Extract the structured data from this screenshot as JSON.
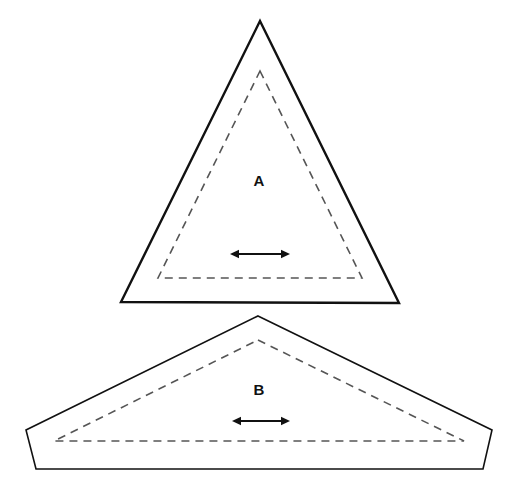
{
  "figure": {
    "background_color": "#ffffff",
    "outline_color": "#111111",
    "dashed_color": "#555555",
    "arrow_color": "#111111",
    "label_color": "#111111",
    "width": 519,
    "height": 496
  },
  "shapes": [
    {
      "id": "shape-a",
      "label": "A",
      "label_position": {
        "x": 259,
        "y": 182
      },
      "outline_kind": "triangle",
      "outline_stroke_width": 2.4,
      "outline_points": "260,21 399,303 121,302",
      "dashed_points": "260,71 362,278 158,278",
      "dashed_stroke_width": 1.6,
      "dash_pattern": "8,6",
      "arrow": {
        "x1": 230,
        "x2": 290,
        "y": 254,
        "stroke_width": 1.8,
        "head_size": 7,
        "double_headed": true
      }
    },
    {
      "id": "shape-b",
      "label": "B",
      "label_position": {
        "x": 259,
        "y": 391
      },
      "outline_kind": "pentagon",
      "outline_stroke_width": 1.6,
      "outline_points": "258,316 492,430 483,469 36,469 26,430",
      "dashed_points": "258,340 464,441 54,441",
      "dashed_stroke_width": 1.6,
      "dash_pattern": "8,6",
      "arrow": {
        "x1": 232,
        "x2": 290,
        "y": 421,
        "stroke_width": 1.8,
        "head_size": 7,
        "double_headed": true
      }
    }
  ]
}
